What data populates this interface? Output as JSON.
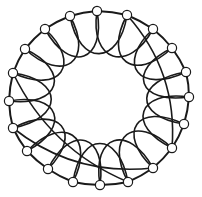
{
  "diagram": {
    "type": "circulant-graph",
    "node_count": 20,
    "colors": {
      "stroke": "#1a1a1a",
      "node_fill": "#ffffff",
      "background": "#ffffff"
    },
    "nodes": [
      {
        "id": 0,
        "x": 97,
        "y": 11
      },
      {
        "id": 1,
        "x": 127,
        "y": 15
      },
      {
        "id": 2,
        "x": 153,
        "y": 29
      },
      {
        "id": 3,
        "x": 172,
        "y": 48
      },
      {
        "id": 4,
        "x": 186,
        "y": 72
      },
      {
        "id": 5,
        "x": 189,
        "y": 97
      },
      {
        "id": 6,
        "x": 184,
        "y": 124
      },
      {
        "id": 7,
        "x": 172,
        "y": 148
      },
      {
        "id": 8,
        "x": 153,
        "y": 168
      },
      {
        "id": 9,
        "x": 128,
        "y": 182
      },
      {
        "id": 10,
        "x": 100,
        "y": 185
      },
      {
        "id": 11,
        "x": 73,
        "y": 182
      },
      {
        "id": 12,
        "x": 48,
        "y": 169
      },
      {
        "id": 13,
        "x": 27,
        "y": 151
      },
      {
        "id": 14,
        "x": 13,
        "y": 128
      },
      {
        "id": 15,
        "x": 9,
        "y": 101
      },
      {
        "id": 16,
        "x": 13,
        "y": 73
      },
      {
        "id": 17,
        "x": 25,
        "y": 49
      },
      {
        "id": 18,
        "x": 45,
        "y": 29
      },
      {
        "id": 19,
        "x": 70,
        "y": 16
      }
    ],
    "long_chords": [
      {
        "from": 14,
        "to": 8
      },
      {
        "from": 16,
        "to": 9
      },
      {
        "from": 1,
        "to": 7
      }
    ]
  }
}
